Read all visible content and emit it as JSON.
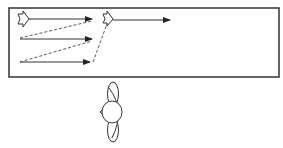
{
  "diagram": {
    "colors": {
      "stroke": "#222222",
      "background": "#ffffff"
    },
    "frame": {
      "x": 9,
      "y": 8,
      "width": 270,
      "height": 69
    },
    "block_arrows": [
      {
        "name": "start-marker",
        "x": 17,
        "y": 12
      },
      {
        "name": "jump-marker",
        "x": 103,
        "y": 12
      }
    ],
    "solid_arrows": [
      {
        "x1": 28,
        "y1": 19,
        "x2": 92,
        "y2": 19
      },
      {
        "x1": 20,
        "y1": 39,
        "x2": 92,
        "y2": 39
      },
      {
        "x1": 20,
        "y1": 62,
        "x2": 90,
        "y2": 62
      },
      {
        "x1": 112,
        "y1": 20,
        "x2": 170,
        "y2": 20
      }
    ],
    "dashed_lines": [
      {
        "x1": 20,
        "y1": 38,
        "x2": 92,
        "y2": 21
      },
      {
        "x1": 20,
        "y1": 62,
        "x2": 92,
        "y2": 41
      },
      {
        "x1": 93,
        "y1": 62,
        "x2": 107,
        "y2": 24
      }
    ],
    "figure": {
      "label": "person-top-view",
      "cx": 111,
      "cy": 112
    }
  }
}
